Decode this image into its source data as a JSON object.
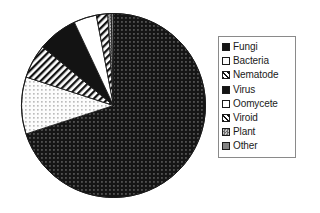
{
  "chart_data": {
    "type": "pie",
    "title": "",
    "subtitle": "",
    "xlabel": "",
    "ylabel": "",
    "legend_position": "right",
    "grid": false,
    "categories": [
      "Fungi",
      "Bacteria",
      "Nematode",
      "Virus",
      "Oomycete",
      "Viroid",
      "Plant",
      "Other"
    ],
    "values": [
      70.0,
      10.0,
      6.0,
      7.0,
      4.0,
      2.0,
      0.6,
      0.4
    ],
    "series": [
      {
        "name": "Share of pathogens",
        "values": [
          70.0,
          10.0,
          6.0,
          7.0,
          4.0,
          2.0,
          0.6,
          0.4
        ]
      }
    ],
    "slices": [
      {
        "label": "Fungi",
        "value": 70.0,
        "fill": "dark-dotted",
        "color": "#151515"
      },
      {
        "label": "Bacteria",
        "value": 10.0,
        "fill": "light-dotted",
        "color": "#fbfbfb"
      },
      {
        "label": "Nematode",
        "value": 6.0,
        "fill": "diagonal-hatch",
        "color": "#ffffff"
      },
      {
        "label": "Virus",
        "value": 7.0,
        "fill": "solid-black",
        "color": "#131313"
      },
      {
        "label": "Oomycete",
        "value": 4.0,
        "fill": "solid-white",
        "color": "#ffffff"
      },
      {
        "label": "Viroid",
        "value": 2.0,
        "fill": "diagonal-hatch",
        "color": "#ffffff"
      },
      {
        "label": "Plant",
        "value": 0.6,
        "fill": "gray-checker",
        "color": "#707070"
      },
      {
        "label": "Other",
        "value": 0.4,
        "fill": "gray-solid",
        "color": "#808080"
      }
    ],
    "start_angle": 0,
    "direction": "clockwise"
  },
  "legend": {
    "title": "",
    "entries": [
      {
        "label": "Fungi"
      },
      {
        "label": "Bacteria"
      },
      {
        "label": "Nematode"
      },
      {
        "label": "Virus"
      },
      {
        "label": "Oomycete"
      },
      {
        "label": "Viroid"
      },
      {
        "label": "Plant"
      },
      {
        "label": "Other"
      }
    ]
  },
  "colors": {
    "outline": "#1a1a1a",
    "legend_border": "#8a8a8a",
    "background": "#ffffff",
    "dark_slice": "#151515",
    "gray_slice": "#787878"
  }
}
